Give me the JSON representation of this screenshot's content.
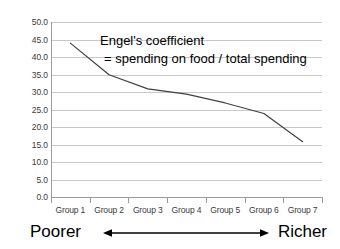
{
  "chart_data": {
    "type": "line",
    "title": "",
    "subtitle": "",
    "xlabel": "",
    "ylabel": "",
    "categories": [
      "Group 1",
      "Group 2",
      "Group 3",
      "Group 4",
      "Group 5",
      "Group 6",
      "Group 7"
    ],
    "series": [
      {
        "name": "Engel's coefficient",
        "values": [
          44.0,
          35.0,
          31.0,
          29.5,
          27.0,
          24.0,
          16.0
        ]
      }
    ],
    "ylim": [
      0.0,
      50.0
    ],
    "ytick_labels": [
      "50.0",
      "45.0",
      "40.0",
      "35.0",
      "30.0",
      "25.0",
      "20.0",
      "15.0",
      "10.0",
      "5.0",
      "0.0"
    ],
    "ytick_values": [
      50.0,
      45.0,
      40.0,
      35.0,
      30.0,
      25.0,
      20.0,
      15.0,
      10.0,
      5.0,
      0.0
    ],
    "grid": true,
    "legend": "none",
    "line_color": "#404040",
    "grid_color": "#c8c8c8",
    "annotations": [
      {
        "line1": "Engel's coefficient",
        "line2": "= spending on food / total spending"
      }
    ]
  },
  "annotation": {
    "line1": "Engel's coefficient",
    "line2": "= spending on food / total spending"
  },
  "footer": {
    "left_label": "Poorer",
    "right_label": "Richer",
    "arrow": "double-headed-arrow"
  }
}
